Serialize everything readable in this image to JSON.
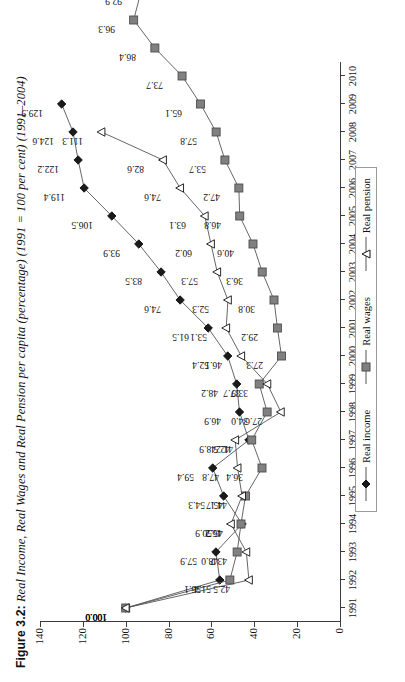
{
  "figure": {
    "label": "Figure 3.2:",
    "title": "Real Income, Real Wages and Real Pension per capita (percentage) (1991 = 100 per cent) (1991–2004)"
  },
  "legend": {
    "position": "bottom",
    "items": [
      {
        "name": "Real income",
        "marker": "filled-diamond",
        "color": "#1a1a1a"
      },
      {
        "name": "Real wages",
        "marker": "filled-square",
        "color": "#808080"
      },
      {
        "name": "Real pension",
        "marker": "open-triangle",
        "color": "#1a1a1a"
      }
    ]
  },
  "axes": {
    "y_ticks": [
      "0",
      "20",
      "40",
      "60",
      "80",
      "100",
      "120",
      "140"
    ],
    "x_ticks": [
      "1991",
      "1992",
      "1993",
      "1994",
      "1995",
      "1996",
      "1997",
      "1998",
      "1999",
      "2000",
      "2001",
      "2002",
      "2003",
      "2004",
      "2005",
      "2006",
      "2007",
      "2008",
      "2009",
      "2010"
    ]
  },
  "chart_data": {
    "type": "line",
    "title": "Real Income, Real Wages and Real Pension per capita (percentage) (1991 = 100 per cent) (1991–2004)",
    "xlabel": "",
    "ylabel": "",
    "ylim": [
      0,
      140
    ],
    "ytick_step": 20,
    "grid": false,
    "legend_position": "bottom",
    "x": [
      "1991",
      "1992",
      "1993",
      "1994",
      "1995",
      "1996",
      "1997",
      "1998",
      "1999",
      "2000",
      "2001",
      "2002",
      "2003",
      "2004",
      "2005",
      "2006",
      "2007",
      "2008",
      "2009",
      "2010"
    ],
    "series": [
      {
        "name": "Real income",
        "marker": "filled-diamond",
        "color": "#1a1a1a",
        "values": [
          100.0,
          56.1,
          57.9,
          45.7,
          54.3,
          59.4,
          42.5,
          46.9,
          48.2,
          52.4,
          61.5,
          74.6,
          83.5,
          93.9,
          106.5,
          119.4,
          122.2,
          124.6,
          129.9,
          null
        ],
        "labels": [
          "100.0",
          "56.1",
          "57.9",
          "45.7",
          "54.3",
          "59.4",
          "42.5",
          "46.9",
          "48.2",
          "52.4",
          "61.5",
          "74.6",
          "83.5",
          "93.9",
          "106.5",
          "119.4",
          "122.2",
          "124.6",
          "129.9",
          ""
        ]
      },
      {
        "name": "Real wages",
        "marker": "filled-square",
        "color": "#808080",
        "values": [
          100.0,
          51.4,
          48.0,
          46.2,
          44.1,
          36.4,
          41.2,
          34.0,
          37.7,
          27.3,
          29.2,
          30.8,
          36.3,
          40.6,
          46.8,
          47.2,
          53.7,
          57.8,
          65.1,
          73.7
        ],
        "labels": [
          "100.0",
          "51.4",
          "48.0",
          "46.2",
          "44.1",
          "36.4",
          "41.2",
          "34.0",
          "37.7",
          "27.3",
          "29.2",
          "30.8",
          "36.3",
          "40.6",
          "46.8",
          "47.2",
          "53.7",
          "57.8",
          "65.1",
          "73.7"
        ],
        "extra_values": [
          86.4,
          96.3,
          92.9,
          97.2
        ],
        "extra_labels": [
          "86.4",
          "96.3",
          "92.9",
          "97.2"
        ]
      },
      {
        "name": "Real pension",
        "marker": "open-triangle",
        "color": "#1a1a1a",
        "values": [
          100.0,
          42.5,
          43.7,
          50.9,
          45.7,
          47.8,
          48.9,
          27.6,
          33.9,
          46.1,
          53.1,
          52.3,
          57.3,
          60.2,
          63.1,
          74.6,
          82.6,
          111.3,
          null,
          null
        ],
        "labels": [
          "100.0",
          "42.5",
          "43.7",
          "50.9",
          "45.7",
          "47.8",
          "48.9",
          "27.6",
          "33.9",
          "46.1",
          "53.1",
          "52.3",
          "57.3",
          "60.2",
          "63.1",
          "74.6",
          "82.6",
          "111.3",
          "",
          ""
        ]
      }
    ],
    "all_point_labels": [
      "100.0",
      "51.4",
      "56.1",
      "57.9",
      "50.9",
      "48.0",
      "46.2",
      "45.7",
      "44.1",
      "43.7",
      "42.5",
      "37.7",
      "34.0",
      "36.4",
      "41.2",
      "47.8",
      "48.9",
      "54.3",
      "59.4",
      "42.5",
      "46.9",
      "48.2",
      "52.4",
      "27.3",
      "27.6",
      "29.2",
      "30.8",
      "33.9",
      "36.3",
      "40.6",
      "46.1",
      "46.8",
      "47.2",
      "53.1",
      "52.3",
      "53.7",
      "57.3",
      "57.8",
      "60.2",
      "61.5",
      "63.1",
      "65.1",
      "73.7",
      "74.6",
      "74.6",
      "82.6",
      "83.5",
      "86.4",
      "92.9",
      "93.9",
      "96.3",
      "97.2",
      "106.5",
      "111.3",
      "119.4",
      "122.2",
      "124.6",
      "129.9"
    ]
  }
}
